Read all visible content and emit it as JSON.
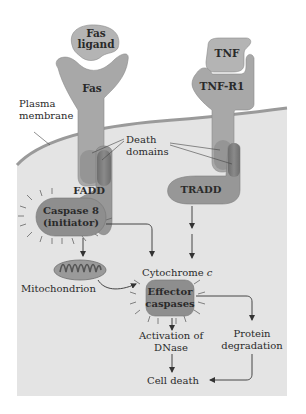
{
  "diagram": {
    "colors": {
      "background": "#ffffff",
      "cytoplasm": "#e4e4e4",
      "membrane": "#9a9a9a",
      "receptor": "#a8a8a8",
      "ligand": "#b4b4b4",
      "adaptor": "#979797",
      "death_domain": "#7c7c7c",
      "caspase": "#8e8e8e",
      "text": "#2a2a2a"
    },
    "labels": {
      "fas_ligand_line1": "Fas",
      "fas_ligand_line2": "ligand",
      "fas": "Fas",
      "tnf": "TNF",
      "tnf_r1": "TNF-R1",
      "plasma_membrane_line1": "Plasma",
      "plasma_membrane_line2": "membrane",
      "death_domains_line1": "Death",
      "death_domains_line2": "domains",
      "fadd": "FADD",
      "tradd": "TRADD",
      "caspase8_line1": "Caspase 8",
      "caspase8_line2": "(initiator)",
      "mitochondrion": "Mitochondrion",
      "cytochrome_c": "Cytochrome",
      "cytochrome_c_italic": "c",
      "effector_line1": "Effector",
      "effector_line2": "caspases",
      "dnase_line1": "Activation of",
      "dnase_line2": "DNase",
      "protein_line1": "Protein",
      "protein_line2": "degradation",
      "cell_death": "Cell death"
    },
    "nodes": [
      {
        "id": "fas_ligand",
        "label": "Fas ligand"
      },
      {
        "id": "fas",
        "label": "Fas"
      },
      {
        "id": "tnf",
        "label": "TNF"
      },
      {
        "id": "tnf_r1",
        "label": "TNF-R1"
      },
      {
        "id": "fadd",
        "label": "FADD"
      },
      {
        "id": "tradd",
        "label": "TRADD"
      },
      {
        "id": "caspase8",
        "label": "Caspase 8 (initiator)"
      },
      {
        "id": "mitochondrion",
        "label": "Mitochondrion"
      },
      {
        "id": "effector",
        "label": "Effector caspases"
      },
      {
        "id": "dnase",
        "label": "Activation of DNase"
      },
      {
        "id": "protein",
        "label": "Protein degradation"
      },
      {
        "id": "cell_death",
        "label": "Cell death"
      }
    ],
    "edges": [
      {
        "from": "caspase8",
        "to": "mitochondrion"
      },
      {
        "from": "caspase8",
        "to": "effector"
      },
      {
        "from": "tradd",
        "to": "effector"
      },
      {
        "from": "mitochondrion",
        "to": "effector",
        "label": "Cytochrome c"
      },
      {
        "from": "effector",
        "to": "dnase"
      },
      {
        "from": "effector",
        "to": "protein"
      },
      {
        "from": "dnase",
        "to": "cell_death"
      },
      {
        "from": "protein",
        "to": "cell_death"
      }
    ]
  }
}
